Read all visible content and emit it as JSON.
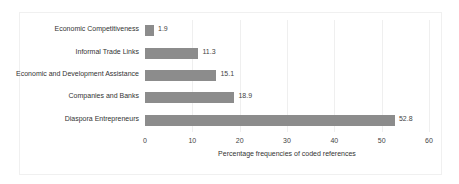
{
  "chart_data": {
    "type": "bar",
    "orientation": "horizontal",
    "title": "",
    "categories": [
      "Economic Competitiveness",
      "Informal Trade Links",
      "Economic and Development Assistance",
      "Companies and Banks",
      "Diaspora Entrepreneurs"
    ],
    "values": [
      1.9,
      11.3,
      15.1,
      18.9,
      52.8
    ],
    "data_labels": [
      "1.9",
      "11.3",
      "15.1",
      "18.9",
      "52.8"
    ],
    "xlabel": "Percentage frequencies of coded references",
    "ylabel": "",
    "xlim": [
      0,
      60
    ],
    "x_ticks": [
      "0",
      "10",
      "20",
      "30",
      "40",
      "50",
      "60"
    ],
    "grid": "vertical",
    "legend": "none",
    "bar_color": "#8c8c8c"
  }
}
